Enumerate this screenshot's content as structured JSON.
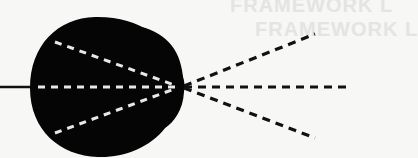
{
  "diagram": {
    "ghost_text": [
      "FRAMEWORK L",
      "FRAMEWORK L"
    ],
    "colors": {
      "background": "#f7f7f5",
      "lens": "#050505",
      "inner_rays": "#e8e8e8",
      "outer_rays": "#111111"
    },
    "incoming_beam": {
      "x1": 0,
      "y1": 87,
      "x2": 34,
      "y2": 87
    },
    "focal_point": {
      "x": 180,
      "y": 87
    },
    "inner_rays": [
      {
        "x1": 55,
        "y1": 42,
        "x2": 178,
        "y2": 87
      },
      {
        "x1": 37,
        "y1": 87,
        "x2": 178,
        "y2": 87
      },
      {
        "x1": 55,
        "y1": 133,
        "x2": 178,
        "y2": 87
      }
    ],
    "outer_rays": [
      {
        "x1": 182,
        "y1": 87,
        "x2": 315,
        "y2": 34
      },
      {
        "x1": 182,
        "y1": 87,
        "x2": 347,
        "y2": 87
      },
      {
        "x1": 182,
        "y1": 87,
        "x2": 315,
        "y2": 138
      }
    ]
  }
}
